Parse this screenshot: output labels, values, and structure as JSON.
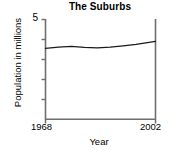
{
  "chart_data": {
    "type": "line",
    "title": "The Suburbs",
    "xlabel": "Year",
    "ylabel": "Population in millions",
    "x": [
      1968,
      1972,
      1976,
      1980,
      1984,
      1988,
      1992,
      1996,
      2002
    ],
    "values": [
      3.55,
      3.62,
      3.65,
      3.6,
      3.58,
      3.62,
      3.68,
      3.75,
      3.9
    ],
    "xlim": [
      1968,
      2002
    ],
    "ylim": [
      0,
      5
    ],
    "x_tick_labels": [
      "1968",
      "2002"
    ],
    "y_tick_labels": [
      "5"
    ],
    "y_minor_ticks": [
      1,
      2,
      3,
      4
    ],
    "grid": false,
    "legend": "none",
    "line_color": "#1a1a1a",
    "axis_color": "#6b6b6b"
  },
  "axes": {
    "title": "The Suburbs",
    "y_label": "Population in millions",
    "y_top_tick": "5",
    "x_label": "Year",
    "x_start_tick": "1968",
    "x_end_tick": "2002"
  }
}
